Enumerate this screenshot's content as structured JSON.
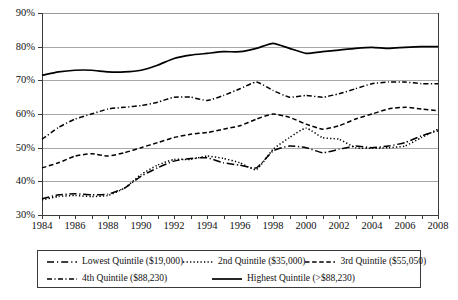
{
  "chart_data": {
    "type": "line",
    "title": "",
    "subtitle": "",
    "xlabel": "",
    "ylabel": "",
    "xlim": [
      1984,
      2008
    ],
    "ylim": [
      30,
      90
    ],
    "y_tick_step": 10,
    "grid": true,
    "grid_axis": "y",
    "legend_position": "bottom",
    "y_tick_labels": [
      "90%",
      "80%",
      "70%",
      "60%",
      "50%",
      "40%",
      "30%"
    ],
    "y_tick_values": [
      90,
      80,
      70,
      60,
      50,
      40,
      30
    ],
    "x": [
      1984,
      1985,
      1986,
      1987,
      1988,
      1989,
      1990,
      1991,
      1992,
      1993,
      1994,
      1995,
      1996,
      1997,
      1998,
      1999,
      2000,
      2001,
      2002,
      2003,
      2004,
      2005,
      2006,
      2007,
      2008
    ],
    "x_tick_labels": [
      "1984",
      "1986",
      "1988",
      "1990",
      "1992",
      "1994",
      "1996",
      "1998",
      "2000",
      "2002",
      "2004",
      "2006",
      "2008"
    ],
    "x_tick_values": [
      1984,
      1986,
      1988,
      1990,
      1992,
      1994,
      1996,
      1998,
      2000,
      2002,
      2004,
      2006,
      2008
    ],
    "series": [
      {
        "name": "Lowest Quintile ($19,000)",
        "dash_style": "long-dash-dot",
        "color": "#000000",
        "values": [
          34.8,
          36.0,
          36.3,
          36.0,
          36.2,
          38.0,
          41.5,
          44.0,
          46.0,
          46.8,
          47.0,
          45.5,
          44.8,
          44.0,
          49.0,
          50.5,
          50.0,
          48.5,
          49.5,
          50.5,
          50.0,
          50.5,
          51.5,
          53.5,
          55.0
        ]
      },
      {
        "name": "2nd Quintile ($35,000)",
        "dash_style": "dotted",
        "color": "#000000",
        "values": [
          34.5,
          35.5,
          35.8,
          35.5,
          35.8,
          38.0,
          42.0,
          44.8,
          46.5,
          46.5,
          47.5,
          46.8,
          45.5,
          43.5,
          49.5,
          53.0,
          55.8,
          53.0,
          52.5,
          50.0,
          49.8,
          50.0,
          50.5,
          53.0,
          55.5
        ]
      },
      {
        "name": "3rd Quintile ($55,050)",
        "dash_style": "dashed",
        "color": "#000000",
        "values": [
          44.0,
          45.5,
          47.5,
          48.2,
          47.5,
          48.5,
          50.0,
          51.5,
          53.0,
          54.0,
          54.5,
          55.5,
          56.5,
          58.5,
          60.0,
          59.0,
          57.0,
          55.5,
          56.5,
          58.5,
          60.0,
          61.5,
          62.0,
          61.5,
          61.0
        ]
      },
      {
        "name": "4th Quintile ($88,230)",
        "dash_style": "dash-dot",
        "color": "#000000",
        "values": [
          52.5,
          56.0,
          58.5,
          60.0,
          61.5,
          62.0,
          62.5,
          63.5,
          65.0,
          65.0,
          64.0,
          65.5,
          67.5,
          69.5,
          67.0,
          65.0,
          65.5,
          65.0,
          66.0,
          67.5,
          69.0,
          69.5,
          69.5,
          69.0,
          69.0
        ]
      },
      {
        "name": "Highest Quintile (>$88,230)",
        "dash_style": "solid",
        "color": "#000000",
        "values": [
          71.5,
          72.5,
          73.0,
          73.0,
          72.5,
          72.5,
          73.0,
          74.5,
          76.5,
          77.5,
          78.0,
          78.5,
          78.5,
          79.5,
          81.0,
          79.5,
          78.0,
          78.5,
          79.0,
          79.5,
          79.8,
          79.5,
          79.8,
          80.0,
          80.0
        ]
      }
    ]
  },
  "legend": {
    "items": [
      {
        "label": "Lowest Quintile ($19,000)"
      },
      {
        "label": "2nd Quintile ($35,000)"
      },
      {
        "label": "3rd Quintile ($55,050)"
      },
      {
        "label": "4th Quintile ($88,230)"
      },
      {
        "label": "Highest Quintile (>$88,230)"
      }
    ]
  }
}
